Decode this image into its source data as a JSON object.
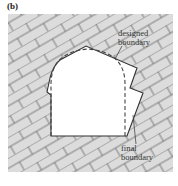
{
  "panel": {
    "label": "(b)"
  },
  "annotations": {
    "designed_boundary": [
      "designed",
      "boundary"
    ],
    "final_boundary": [
      "final",
      "boundary"
    ]
  },
  "colors": {
    "rock_fill": "#dcdcdc",
    "joint_lines": "#555555",
    "opening_fill": "#ffffff",
    "final_boundary_stroke": "#333333",
    "designed_boundary_stroke": "#444444"
  },
  "figure": {
    "joint_set_angle_deg": -30
  }
}
